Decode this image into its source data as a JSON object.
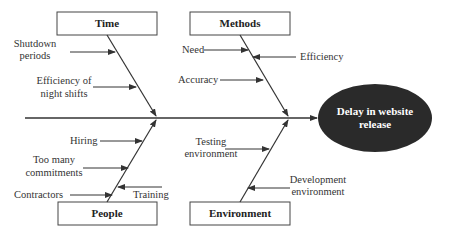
{
  "diagram": {
    "type": "fishbone",
    "effect": {
      "line1": "Delay in website",
      "line2": "release",
      "fill": "#2a2a2a"
    },
    "categories": {
      "time": {
        "label": "Time",
        "causes": [
          {
            "line1": "Shutdown",
            "line2": "periods"
          },
          {
            "line1": "Efficiency of",
            "line2": "night shifts"
          }
        ]
      },
      "methods": {
        "label": "Methods",
        "causes": [
          {
            "line1": "Need"
          },
          {
            "line1": "Efficiency"
          },
          {
            "line1": "Accuracy"
          }
        ]
      },
      "people": {
        "label": "People",
        "causes": [
          {
            "line1": "Hiring"
          },
          {
            "line1": "Too many",
            "line2": "commitments"
          },
          {
            "line1": "Contractors"
          },
          {
            "line1": "Training"
          }
        ]
      },
      "environment": {
        "label": "Environment",
        "causes": [
          {
            "line1": "Testing",
            "line2": "environment"
          },
          {
            "line1": "Development",
            "line2": "environment"
          }
        ]
      }
    },
    "colors": {
      "line": "#333333",
      "box_border": "#444444",
      "text": "#333333"
    }
  }
}
